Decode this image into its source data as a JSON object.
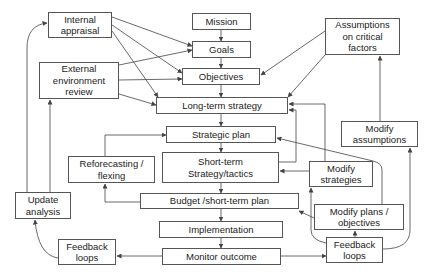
{
  "diagram": {
    "nodes": {
      "mission": "Mission",
      "goals": "Goals",
      "objectives": "Objectives",
      "long_term_strategy": "Long-term strategy",
      "strategic_plan": "Strategic plan",
      "short_term": "Short-term\nStrategy/tactics",
      "budget": "Budget /short-term plan",
      "implementation": "Implementation",
      "monitor_outcome": "Monitor outcome",
      "internal_appraisal": "Internal\nappraisal",
      "external_review": "External\nenvironment\nreview",
      "assumptions": "Assumptions\non critical\nfactors",
      "reforecasting": "Reforecasting /\nflexing",
      "update_analysis": "Update\nanalysis",
      "feedback_left": "Feedback\nloops",
      "feedback_right": "Feedback\nloops",
      "modify_assumptions": "Modify\nassumptions",
      "modify_strategies": "Modify\nstrategies",
      "modify_plans": "Modify plans /\nobjectives"
    },
    "colors": {
      "line": "#444444",
      "box_border": "#555555",
      "text": "#222222",
      "background": "#ffffff"
    }
  }
}
